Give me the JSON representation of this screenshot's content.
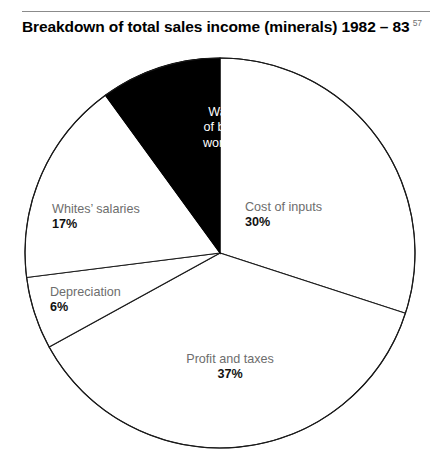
{
  "header": {
    "title": "Breakdown of total sales income (minerals) 1982 – 83",
    "footnote_marker": "57"
  },
  "chart_data": {
    "type": "pie",
    "title": "Breakdown of total sales income (minerals) 1982 – 83",
    "subtitle": "",
    "xlabel": "",
    "ylabel": "",
    "units": "percent",
    "total": 100,
    "legend_position": "none",
    "grid": false,
    "start_angle_deg": 0,
    "direction": "clockwise",
    "categories": [
      "Cost of inputs",
      "Profit and taxes",
      "Depreciation",
      "Whites' salaries",
      "Wages of black workers"
    ],
    "values": [
      30,
      37,
      6,
      17,
      10
    ],
    "slices": [
      {
        "label": "Cost of inputs",
        "value": 30,
        "value_label": "30%",
        "fill": "#ffffff",
        "stroke": "#1a1a1a",
        "text_color": "#6d6d6d",
        "label_inside": true,
        "start_deg": 0,
        "end_deg": 108
      },
      {
        "label": "Profit and taxes",
        "value": 37,
        "value_label": "37%",
        "fill": "#ffffff",
        "stroke": "#1a1a1a",
        "text_color": "#6d6d6d",
        "label_inside": true,
        "start_deg": 108,
        "end_deg": 241.2
      },
      {
        "label": "Depreciation",
        "value": 6,
        "value_label": "6%",
        "fill": "#ffffff",
        "stroke": "#1a1a1a",
        "text_color": "#6d6d6d",
        "label_inside": true,
        "start_deg": 241.2,
        "end_deg": 262.8
      },
      {
        "label": "Whites' salaries",
        "value": 17,
        "value_label": "17%",
        "fill": "#ffffff",
        "stroke": "#1a1a1a",
        "text_color": "#6d6d6d",
        "label_inside": true,
        "start_deg": 262.8,
        "end_deg": 324
      },
      {
        "label": "Wages of black workers",
        "value": 10,
        "value_label": "10%",
        "fill": "#000000",
        "stroke": "#000000",
        "text_color": "#ffffff",
        "label_inside": true,
        "start_deg": 324,
        "end_deg": 360
      }
    ]
  },
  "labels": {
    "wages": {
      "line1": "Wages",
      "line2": "of black",
      "line3": "workers",
      "value": "10%"
    },
    "cost_of_inputs": {
      "name": "Cost of inputs",
      "value": "30%"
    },
    "whites_salaries": {
      "name": "Whites’ salaries",
      "value": "17%"
    },
    "depreciation": {
      "name": "Depreciation",
      "value": "6%"
    },
    "profit_and_taxes": {
      "name": "Profit and taxes",
      "value": "37%"
    }
  },
  "colors": {
    "highlight_slice": "#000000",
    "plain_slice": "#ffffff",
    "outline": "#1a1a1a",
    "label_name": "#6d6d6d",
    "label_value": "#111111",
    "rule": "#8b8b8b",
    "footnote": "#6f6f6f"
  }
}
